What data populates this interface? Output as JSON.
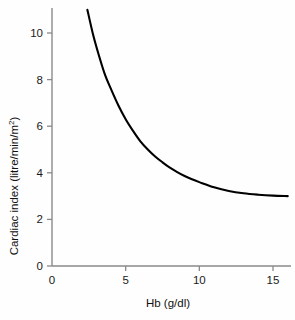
{
  "chart_data": {
    "type": "line",
    "title": "",
    "xlabel": "Hb (g/dl)",
    "ylabel": "Cardiac index (litre/min/m2)",
    "ylabel_main": "Cardiac index (litre/min/m",
    "ylabel_sup": "2",
    "ylabel_close": ")",
    "xlim": [
      0,
      16
    ],
    "ylim": [
      0,
      11.4
    ],
    "xticks": [
      0,
      5,
      10,
      15
    ],
    "xticklabels": [
      "0",
      "5",
      "10",
      "15"
    ],
    "yticks": [
      0,
      2,
      4,
      6,
      8,
      10
    ],
    "yticklabels": [
      "0",
      "2",
      "4",
      "6",
      "8",
      "10"
    ],
    "grid": false,
    "legend": null,
    "series": [
      {
        "name": "Cardiac index vs Hb",
        "color": "#000000",
        "x": [
          2.4,
          2.8,
          3.2,
          3.6,
          4.0,
          4.5,
          5.0,
          5.5,
          6.0,
          6.5,
          7.0,
          7.5,
          8.0,
          8.5,
          9.0,
          9.5,
          10.0,
          11.0,
          12.0,
          13.0,
          14.0,
          15.0,
          16.0
        ],
        "y": [
          11.0,
          9.9,
          9.0,
          8.2,
          7.6,
          6.9,
          6.3,
          5.8,
          5.35,
          5.0,
          4.7,
          4.45,
          4.22,
          4.03,
          3.86,
          3.72,
          3.6,
          3.38,
          3.22,
          3.12,
          3.06,
          3.02,
          3.0
        ]
      }
    ]
  },
  "axes": {
    "y_axis_name": "cardiac-index-axis",
    "x_axis_name": "hb-axis"
  }
}
